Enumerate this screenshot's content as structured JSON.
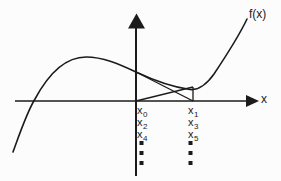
{
  "colors": {
    "ink": "#1b1b1b",
    "background": "#fcfcfc"
  },
  "curve_label": "f(x)",
  "x_axis_label": "x",
  "iterates": {
    "left_column": [
      {
        "base": "x",
        "sub": "0"
      },
      {
        "base": "x",
        "sub": "2"
      },
      {
        "base": "x",
        "sub": "4"
      }
    ],
    "right_column": [
      {
        "base": "x",
        "sub": "1"
      },
      {
        "base": "x",
        "sub": "3"
      },
      {
        "base": "x",
        "sub": "5"
      }
    ]
  },
  "ellipsis": {
    "columns": 2,
    "dots_per_column": 3
  }
}
